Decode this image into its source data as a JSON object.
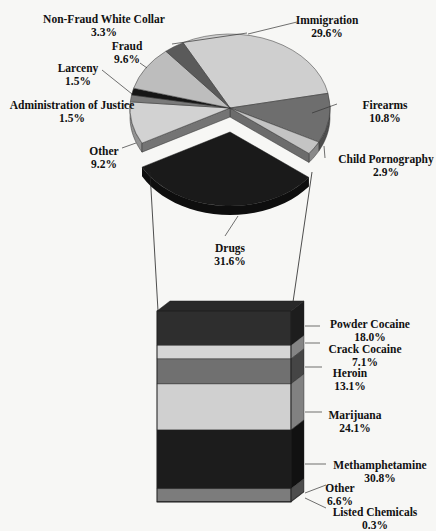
{
  "chart_data": [
    {
      "type": "pie",
      "title": "",
      "style": "3d-exploded",
      "slices": [
        {
          "label": "Immigration",
          "value": 29.6,
          "display": "29.6%",
          "color": "#cfcfcf"
        },
        {
          "label": "Firearms",
          "value": 10.8,
          "display": "10.8%",
          "color": "#6e6e6e"
        },
        {
          "label": "Child Pornography",
          "value": 2.9,
          "display": "2.9%",
          "color": "#c4c4c4"
        },
        {
          "label": "Drugs",
          "value": 31.6,
          "display": "31.6%",
          "color": "#1a1a1a",
          "exploded": true
        },
        {
          "label": "Other",
          "value": 9.2,
          "display": "9.2%",
          "color": "#d2d2d2"
        },
        {
          "label": "Administration of Justice",
          "value": 1.5,
          "display": "1.5%",
          "color": "#7a7a7a"
        },
        {
          "label": "Larceny",
          "value": 1.5,
          "display": "1.5%",
          "color": "#151515"
        },
        {
          "label": "Fraud",
          "value": 9.6,
          "display": "9.6%",
          "color": "#bdbdbd"
        },
        {
          "label": "Non-Fraud White Collar",
          "value": 3.3,
          "display": "3.3%",
          "color": "#5a5a5a"
        }
      ]
    },
    {
      "type": "bar",
      "style": "3d-stacked-single",
      "parent_slice": "Drugs",
      "categories": [
        "Powder Cocaine",
        "Crack Cocaine",
        "Heroin",
        "Marijuana",
        "Methamphetamine",
        "Other",
        "Listed Chemicals"
      ],
      "values": [
        18.0,
        7.1,
        13.1,
        24.1,
        30.8,
        6.6,
        0.3
      ],
      "displays": [
        "18.0%",
        "7.1%",
        "13.1%",
        "24.1%",
        "30.8%",
        "6.6%",
        "0.3%"
      ],
      "colors": [
        "#2e2e2e",
        "#d6d6d6",
        "#707070",
        "#d0d0d0",
        "#1c1c1c",
        "#7c7c7c",
        "#3a3a3a"
      ]
    }
  ],
  "pie_labels": [
    {
      "name": "Non-Fraud White Collar",
      "pct": "3.3%"
    },
    {
      "name": "Immigration",
      "pct": "29.6%"
    },
    {
      "name": "Fraud",
      "pct": "9.6%"
    },
    {
      "name": "Larceny",
      "pct": "1.5%"
    },
    {
      "name": "Administration of Justice",
      "pct": "1.5%"
    },
    {
      "name": "Firearms",
      "pct": "10.8%"
    },
    {
      "name": "Other",
      "pct": "9.2%"
    },
    {
      "name": "Child Pornography",
      "pct": "2.9%"
    },
    {
      "name": "Drugs",
      "pct": "31.6%"
    }
  ],
  "bar_labels": [
    {
      "name": "Powder Cocaine",
      "pct": "18.0%"
    },
    {
      "name": "Crack Cocaine",
      "pct": "7.1%"
    },
    {
      "name": "Heroin",
      "pct": "13.1%"
    },
    {
      "name": "Marijuana",
      "pct": "24.1%"
    },
    {
      "name": "Methamphetamine",
      "pct": "30.8%"
    },
    {
      "name": "Other",
      "pct": "6.6%"
    },
    {
      "name": "Listed Chemicals",
      "pct": "0.3%"
    }
  ]
}
